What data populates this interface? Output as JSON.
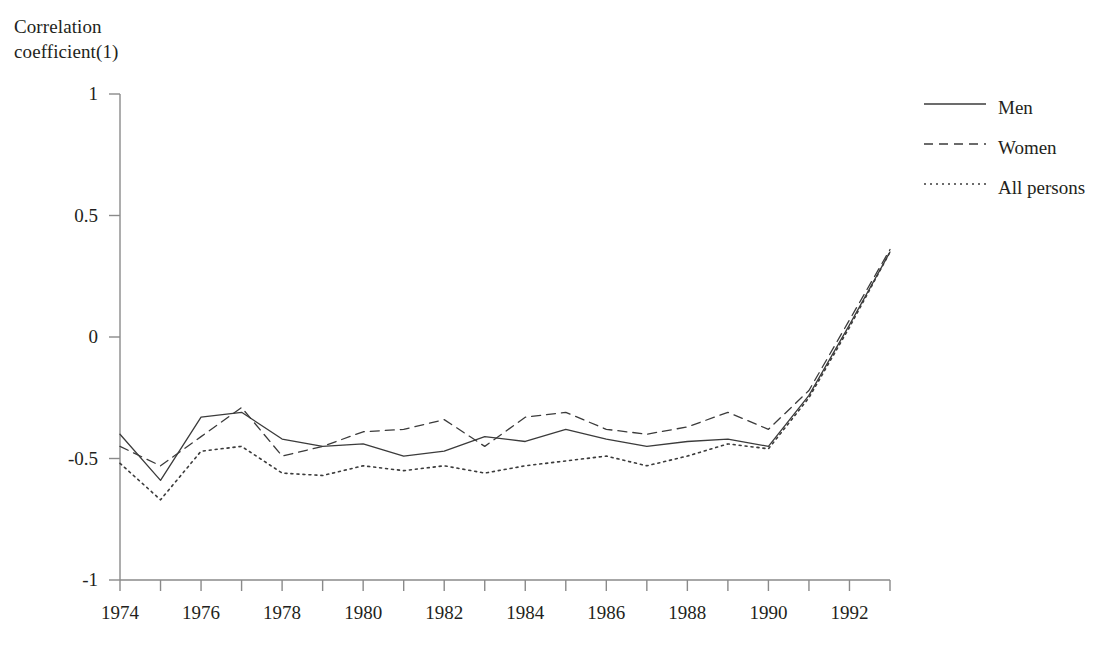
{
  "chart_data": {
    "type": "line",
    "title": "",
    "subtitle": "",
    "xlabel": "",
    "ylabel": "Correlation\ncoefficient(1)",
    "ylim": [
      -1,
      1
    ],
    "xlim": [
      1974,
      1993
    ],
    "yticks": [
      "1",
      "0.5",
      "0",
      "-0.5",
      "-1"
    ],
    "ytick_values": [
      1,
      0.5,
      0,
      -0.5,
      -1
    ],
    "x": [
      1974,
      1975,
      1976,
      1977,
      1978,
      1979,
      1980,
      1981,
      1982,
      1983,
      1984,
      1985,
      1986,
      1987,
      1988,
      1989,
      1990,
      1991,
      1992,
      1993
    ],
    "xticks_major": [
      "1974",
      "1976",
      "1978",
      "1980",
      "1982",
      "1984",
      "1986",
      "1988",
      "1990",
      "1992"
    ],
    "xtick_values_major": [
      1974,
      1976,
      1978,
      1980,
      1982,
      1984,
      1986,
      1988,
      1990,
      1992
    ],
    "grid": false,
    "legend_position": "right",
    "series": [
      {
        "name": "Men",
        "style": "solid",
        "color": "#3b3b3b",
        "values": [
          -0.4,
          -0.59,
          -0.33,
          -0.31,
          -0.42,
          -0.45,
          -0.44,
          -0.49,
          -0.47,
          -0.41,
          -0.43,
          -0.38,
          -0.42,
          -0.45,
          -0.43,
          -0.42,
          -0.45,
          -0.24,
          0.05,
          0.35
        ]
      },
      {
        "name": "Women",
        "style": "dashed",
        "color": "#3b3b3b",
        "values": [
          -0.45,
          -0.53,
          -0.41,
          -0.29,
          -0.49,
          -0.45,
          -0.39,
          -0.38,
          -0.34,
          -0.45,
          -0.33,
          -0.31,
          -0.38,
          -0.4,
          -0.37,
          -0.31,
          -0.38,
          -0.22,
          0.07,
          0.36
        ]
      },
      {
        "name": "All persons",
        "style": "dotted",
        "color": "#3b3b3b",
        "values": [
          -0.52,
          -0.67,
          -0.47,
          -0.45,
          -0.56,
          -0.57,
          -0.53,
          -0.55,
          -0.53,
          -0.56,
          -0.53,
          -0.51,
          -0.49,
          -0.53,
          -0.49,
          -0.44,
          -0.46,
          -0.25,
          0.04,
          0.35
        ]
      }
    ]
  },
  "legend": {
    "items": [
      {
        "label": "Men",
        "style": "solid"
      },
      {
        "label": "Women",
        "style": "dashed"
      },
      {
        "label": "All persons",
        "style": "dotted"
      }
    ]
  },
  "axis": {
    "y_title": "Correlation\ncoefficient(1)"
  },
  "colors": {
    "line": "#3b3b3b",
    "axis": "#8a8a8a",
    "text": "#231f20",
    "background": "#ffffff"
  }
}
